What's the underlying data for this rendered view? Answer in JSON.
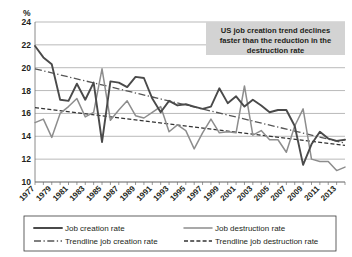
{
  "chart_data": {
    "type": "line",
    "title": "",
    "xlabel": "",
    "ylabel": "%",
    "ylim": [
      10,
      24
    ],
    "ytick_step": 2,
    "yticks": [
      10,
      12,
      14,
      16,
      18,
      20,
      22,
      24
    ],
    "xlim": [
      1977,
      2014
    ],
    "xtick_labels": [
      "1977",
      "1979",
      "1981",
      "1983",
      "1985",
      "1987",
      "1989",
      "1991",
      "1993",
      "1995",
      "1997",
      "1999",
      "2001",
      "2003",
      "2005",
      "2007",
      "2009",
      "2011",
      "2013"
    ],
    "grid": true,
    "legend_position": "bottom",
    "x": [
      1977,
      1978,
      1979,
      1980,
      1981,
      1982,
      1983,
      1984,
      1985,
      1986,
      1987,
      1988,
      1989,
      1990,
      1991,
      1992,
      1993,
      1994,
      1995,
      1996,
      1997,
      1998,
      1999,
      2000,
      2001,
      2002,
      2003,
      2004,
      2005,
      2006,
      2007,
      2008,
      2009,
      2010,
      2011,
      2012,
      2013,
      2014
    ],
    "series": [
      {
        "name": "Job creation rate",
        "style": "solid-thick",
        "color": "#4a4a4a",
        "values": [
          21.9,
          20.9,
          20.3,
          17.2,
          17.1,
          18.6,
          17.2,
          18.7,
          13.5,
          18.8,
          18.7,
          18.3,
          19.2,
          19.1,
          17.3,
          16.1,
          17.1,
          16.7,
          16.8,
          16.6,
          16.4,
          16.6,
          18.2,
          16.9,
          17.5,
          16.6,
          17.2,
          16.7,
          16.1,
          16.3,
          16.3,
          14.9,
          11.5,
          13.3,
          14.4,
          13.8,
          13.6,
          13.7
        ]
      },
      {
        "name": "Job destruction rate",
        "style": "solid-thin",
        "color": "#8d8d8d",
        "values": [
          15.2,
          15.5,
          13.9,
          16.0,
          16.6,
          17.3,
          15.7,
          16.1,
          19.9,
          15.4,
          16.3,
          17.1,
          15.8,
          15.6,
          16.1,
          16.6,
          14.4,
          15.0,
          14.5,
          12.9,
          14.3,
          15.5,
          14.3,
          14.4,
          14.3,
          18.4,
          14.1,
          14.5,
          13.7,
          13.7,
          12.6,
          14.9,
          16.4,
          12.0,
          11.8,
          11.8,
          11.0,
          11.3
        ]
      }
    ],
    "trendlines": [
      {
        "name": "Trendline job creation rate",
        "style": "dash-dot",
        "color": "#555555",
        "start_value": 19.9,
        "end_value": 13.4
      },
      {
        "name": "Trendline job destruction rate",
        "style": "dashed",
        "color": "#333333",
        "start_value": 16.5,
        "end_value": 13.2
      }
    ],
    "annotation": {
      "lines": [
        "US job creation trend declines",
        "faster than the reduction in the",
        "destruction rate"
      ],
      "background_color": "#d3d3d3"
    }
  },
  "legend": {
    "items": [
      {
        "label": "Job creation rate",
        "marker": "solid-thick"
      },
      {
        "label": "Job destruction rate",
        "marker": "solid-thin"
      },
      {
        "label": "Trendline job creation rate",
        "marker": "dash-dot"
      },
      {
        "label": "Trendline job destruction rate",
        "marker": "dashed"
      }
    ]
  }
}
